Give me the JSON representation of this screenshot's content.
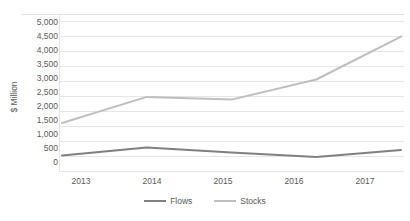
{
  "chart_data": {
    "type": "line",
    "title": "",
    "subtitle": "",
    "xlabel": "",
    "ylabel": "$ Million",
    "categories": [
      "2013",
      "2014",
      "2015",
      "2016",
      "2017"
    ],
    "series": [
      {
        "name": "Flows",
        "color": "#808080",
        "values": [
          520,
          780,
          620,
          470,
          700
        ]
      },
      {
        "name": "Stocks",
        "color": "#bfbfbf",
        "values": [
          1600,
          2470,
          2380,
          3050,
          4480
        ]
      }
    ],
    "ylim": [
      0,
      5000
    ],
    "ytick_step": 500,
    "ytick_labels": [
      "5,000",
      "4,500",
      "4,000",
      "3,500",
      "3,000",
      "2,500",
      "2,000",
      "1,500",
      "1,000",
      "500",
      "0"
    ],
    "grid": {
      "horizontal": true,
      "vertical": false,
      "color": "#e6e6e6"
    },
    "legend": {
      "position": "bottom",
      "orientation": "horizontal",
      "entries": [
        "Flows",
        "Stocks"
      ]
    },
    "background": "#ffffff",
    "axis_text_color": "#5a5a5a"
  }
}
